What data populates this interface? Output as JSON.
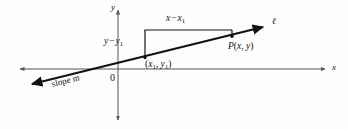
{
  "figure": {
    "kind": "coordinate-geometry-diagram",
    "background_color": "#fefefe",
    "ink_color": "#111111",
    "axis_color": "#555555"
  },
  "axes": {
    "y_axis_label": "y",
    "x_axis_label": "x",
    "origin_label": "0"
  },
  "line": {
    "name_label": "ℓ",
    "slope_label": "slope m"
  },
  "points": {
    "point1_label": {
      "open": "(",
      "x": "x",
      "x_sub": "1",
      "comma": ", ",
      "y": "y",
      "y_sub": "1",
      "close": ")"
    },
    "point_p_label": {
      "name": "P",
      "open": "(",
      "x": "x",
      "comma": ", ",
      "y": "y",
      "close": ")"
    }
  },
  "measurements": {
    "run_label": {
      "lead": "x",
      "minus": "−",
      "trail": "x",
      "trail_sub": "1"
    },
    "rise_label": {
      "lead": "y",
      "minus": "−",
      "trail": "y",
      "trail_sub": "1"
    }
  },
  "geometry": {
    "x_axis_y": 69,
    "y_axis_x": 118,
    "x_axis_start": 20,
    "x_axis_end": 325,
    "y_axis_top": 10,
    "y_axis_bottom": 120,
    "line_left_end": [
      30,
      85
    ],
    "line_right_end": [
      265,
      26
    ],
    "point1": [
      145,
      57
    ],
    "point_p": [
      232,
      38
    ],
    "corner": [
      145,
      30
    ]
  }
}
